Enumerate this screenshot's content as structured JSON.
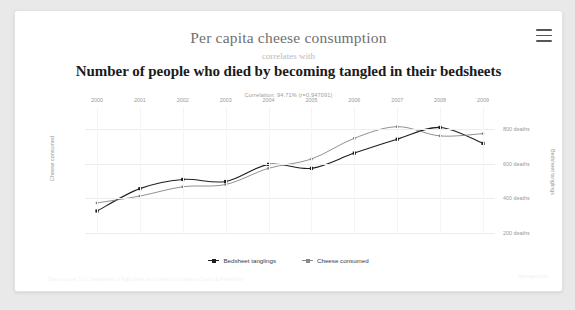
{
  "menu": {
    "icon": "hamburger-menu-icon",
    "label": "Menu"
  },
  "header": {
    "title_top": "Per capita cheese consumption",
    "connector": "correlates with",
    "title_bottom": "Number of people who died by becoming tangled in their bedsheets",
    "correlation_text": "Correlation: 94.71% (r=0.947091)"
  },
  "footer": {
    "sources": "Data sources: U.S. Department of Agriculture and Centers for Disease Control & Prevention",
    "watermark": "tylervigen.com"
  },
  "colors": {
    "bedsheet_line": "#1f1f1f",
    "cheese_line": "#7d7d7d",
    "grid": "#ededed",
    "axis_text": "#9a9a9a",
    "card_bg": "#ffffff",
    "page_bg": "#e9e9e9"
  },
  "chart_data": {
    "type": "line",
    "title": "Per capita cheese consumption correlates with Number of people who died by becoming tangled in their bedsheets",
    "subtitle": "Correlation: 94.71% (r=0.947091)",
    "xlabel": "",
    "x_axis_position": "top",
    "grid": true,
    "legend": "bottom",
    "categories": [
      "2000",
      "2001",
      "2002",
      "2003",
      "2004",
      "2005",
      "2006",
      "2007",
      "2008",
      "2009"
    ],
    "axes": {
      "left": {
        "label": "Cheese consumed",
        "ticks": [
          "28.5lbs",
          "30lbs",
          "31.5lbs",
          "33lbs"
        ],
        "tick_values": [
          28.5,
          30,
          31.5,
          33
        ],
        "unit": "lbs",
        "lim": [
          28.5,
          33
        ]
      },
      "right": {
        "label": "Bedsheet tanglings",
        "ticks": [
          "200 deaths",
          "400 deaths",
          "600 deaths",
          "800 deaths"
        ],
        "tick_values": [
          200,
          400,
          600,
          800
        ],
        "unit": "deaths",
        "lim": [
          200,
          800
        ]
      }
    },
    "series": [
      {
        "name": "Bedsheet tanglings",
        "axis": "right",
        "unit": "deaths",
        "color": "#1f1f1f",
        "values": [
          327,
          456,
          509,
          497,
          596,
          573,
          661,
          741,
          809,
          717
        ]
      },
      {
        "name": "Cheese consumed",
        "axis": "left",
        "unit": "lbs",
        "color": "#7d7d7d",
        "values": [
          29.8,
          30.1,
          30.5,
          30.6,
          31.3,
          31.7,
          32.6,
          33.1,
          32.7,
          32.8
        ]
      }
    ]
  }
}
